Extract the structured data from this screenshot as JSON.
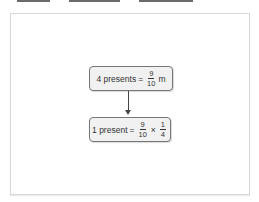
{
  "top_bars": [
    {
      "left": 17,
      "width": 33
    },
    {
      "left": 69,
      "width": 51
    },
    {
      "left": 139,
      "width": 54
    }
  ],
  "diagram": {
    "box1": {
      "lhs": "4 presents",
      "eq": "=",
      "frac_num": "9",
      "frac_den": "10",
      "unit": "m"
    },
    "arrow": "down-arrow",
    "box2": {
      "lhs": "1 present",
      "eq": "=",
      "frac1_num": "9",
      "frac1_den": "10",
      "op": "×",
      "frac2_num": "1",
      "frac2_den": "4"
    }
  },
  "colors": {
    "box_fill": "#f1f1f1",
    "box_border": "#777777",
    "panel_border": "#d8d8d8"
  }
}
